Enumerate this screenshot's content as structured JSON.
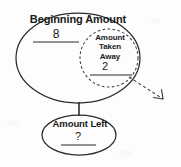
{
  "diagram": {
    "type": "part-part-whole subtraction model",
    "whole": {
      "label": "Beginning Amount",
      "value": "8"
    },
    "part_removed": {
      "label_line_1": "Amount",
      "label_line_2": "Taken",
      "label_line_3": "Away",
      "label_full": "Amount Taken Away",
      "value": "2"
    },
    "part_remaining": {
      "label": "Amount Left",
      "value": "?"
    },
    "colors": {
      "stroke": "#2b2b2b",
      "text": "#1a1a1a",
      "background": "#fdfdfd"
    },
    "shapes": {
      "whole_shape": "ellipse-solid",
      "removed_shape": "circle-dashed",
      "remaining_shape": "ellipse-solid",
      "connector": "vertical-line",
      "removal_indicator": "dashed-arrow-outward"
    }
  }
}
